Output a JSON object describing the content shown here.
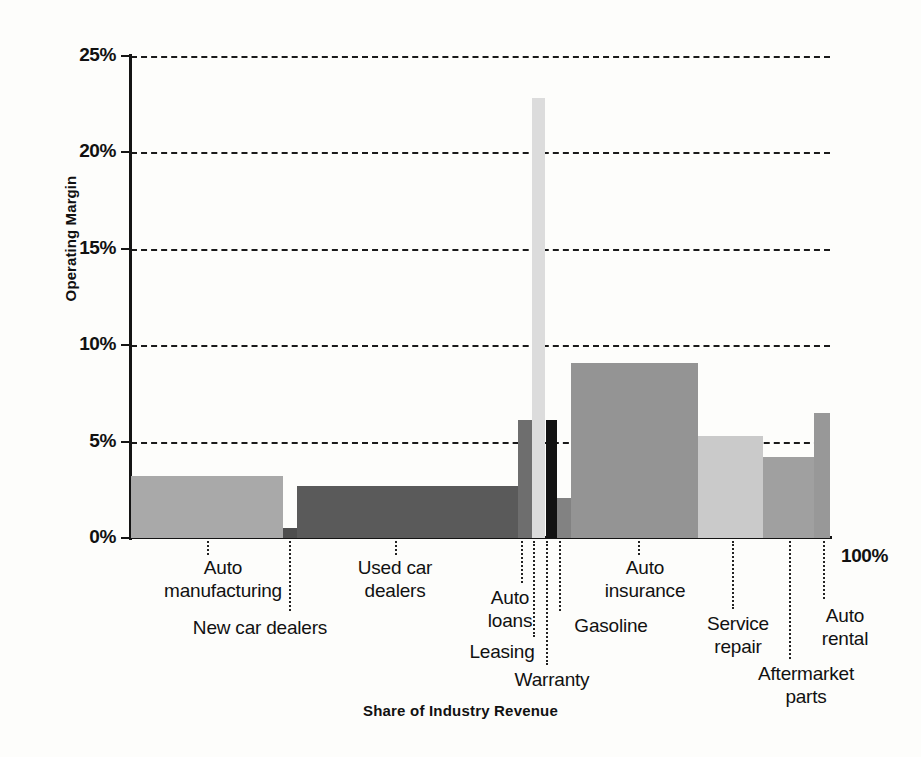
{
  "chart_data": {
    "type": "bar",
    "title": "",
    "subtitle": "",
    "xlabel": "Share of Industry Revenue",
    "ylabel": "Operating Margin",
    "ylim": [
      0,
      25
    ],
    "xlim": [
      0,
      100
    ],
    "y_tick_labels": [
      "0%",
      "5%",
      "10%",
      "15%",
      "20%",
      "25%"
    ],
    "y_tick_values": [
      0,
      5,
      10,
      15,
      20,
      25
    ],
    "x_end_label": "100%",
    "grid": "horizontal-dashed",
    "legend": "none",
    "note": "Marimekko / variable-width bar chart: bar width = share of industry revenue (%), bar height = operating margin (%)",
    "categories": [
      "Auto manufacturing",
      "New car dealers",
      "Used car dealers",
      "Auto loans",
      "Leasing",
      "Warranty",
      "Gasoline",
      "Auto insurance",
      "Service repair",
      "Aftermarket parts",
      "Auto rental"
    ],
    "series": [
      {
        "name": "Operating Margin",
        "values": [
          3.2,
          0.5,
          2.7,
          6.1,
          22.8,
          6.1,
          2.1,
          9.1,
          5.3,
          4.2,
          6.5
        ]
      },
      {
        "name": "Share of Industry Revenue",
        "values": [
          21.7,
          2.0,
          31.6,
          1.9,
          2.0,
          1.6,
          2.0,
          18.2,
          9.3,
          7.4,
          2.3
        ]
      }
    ],
    "bars": [
      {
        "label": "Auto manufacturing",
        "label_display": "Auto\nmanufacturing",
        "margin": 3.2,
        "share_start": 0.0,
        "share_end": 21.7,
        "fill": "#a9a9a9",
        "label_x": 148,
        "label_y": 556,
        "label_w": 150,
        "align": "center",
        "leader_x": 207,
        "leader_top": 541,
        "leader_h": 14
      },
      {
        "label": "New car dealers",
        "label_display": "New car dealers",
        "margin": 0.5,
        "share_start": 21.7,
        "share_end": 23.8,
        "fill": "#4e4e4e",
        "label_x": 160,
        "label_y": 616,
        "label_w": 200,
        "align": "center",
        "leader_x": 289,
        "leader_top": 541,
        "leader_h": 70
      },
      {
        "label": "Used car dealers",
        "label_display": "Used car\ndealers",
        "margin": 2.7,
        "share_start": 23.8,
        "share_end": 55.4,
        "fill": "#5a5a5a",
        "label_x": 320,
        "label_y": 556,
        "label_w": 150,
        "align": "center",
        "leader_x": 395,
        "leader_top": 541,
        "leader_h": 14
      },
      {
        "label": "Auto loans",
        "label_display": "Auto\nloans",
        "margin": 6.1,
        "share_start": 55.4,
        "share_end": 57.3,
        "fill": "#6e6e6e",
        "label_x": 470,
        "label_y": 586,
        "label_w": 80,
        "align": "center",
        "leader_x": 521,
        "leader_top": 541,
        "leader_h": 42
      },
      {
        "label": "Leasing",
        "label_display": "Leasing",
        "margin": 22.8,
        "share_start": 57.3,
        "share_end": 59.3,
        "fill": "#dcdcdc",
        "label_x": 452,
        "label_y": 640,
        "label_w": 100,
        "align": "center",
        "leader_x": 533,
        "leader_top": 541,
        "leader_h": 96
      },
      {
        "label": "Warranty",
        "label_display": "Warranty",
        "margin": 6.1,
        "share_start": 59.3,
        "share_end": 60.9,
        "fill": "#121212",
        "label_x": 492,
        "label_y": 668,
        "label_w": 120,
        "align": "center",
        "leader_x": 546,
        "leader_top": 541,
        "leader_h": 124
      },
      {
        "label": "Gasoline",
        "label_display": "Gasoline",
        "margin": 2.1,
        "share_start": 60.9,
        "share_end": 62.9,
        "fill": "#828282",
        "label_x": 556,
        "label_y": 614,
        "label_w": 110,
        "align": "center",
        "leader_x": 559,
        "leader_top": 541,
        "leader_h": 70
      },
      {
        "label": "Auto insurance",
        "label_display": "Auto\ninsurance",
        "margin": 9.1,
        "share_start": 62.9,
        "share_end": 81.1,
        "fill": "#949494",
        "label_x": 575,
        "label_y": 556,
        "label_w": 140,
        "align": "center",
        "leader_x": 638,
        "leader_top": 541,
        "leader_h": 14
      },
      {
        "label": "Service repair",
        "label_display": "Service\nrepair",
        "margin": 5.3,
        "share_start": 81.1,
        "share_end": 90.4,
        "fill": "#cacaca",
        "label_x": 678,
        "label_y": 612,
        "label_w": 120,
        "align": "center",
        "leader_x": 732,
        "leader_top": 541,
        "leader_h": 68
      },
      {
        "label": "Aftermarket parts",
        "label_display": "Aftermarket\nparts",
        "margin": 4.2,
        "share_start": 90.4,
        "share_end": 97.7,
        "fill": "#a0a0a0",
        "label_x": 716,
        "label_y": 662,
        "label_w": 180,
        "align": "center",
        "leader_x": 789,
        "leader_top": 541,
        "leader_h": 118
      },
      {
        "label": "Auto rental",
        "label_display": "Auto\nrental",
        "margin": 6.5,
        "share_start": 97.7,
        "share_end": 100.0,
        "fill": "#989898",
        "label_x": 790,
        "label_y": 604,
        "label_w": 110,
        "align": "center",
        "leader_x": 823,
        "leader_top": 541,
        "leader_h": 58
      }
    ]
  }
}
